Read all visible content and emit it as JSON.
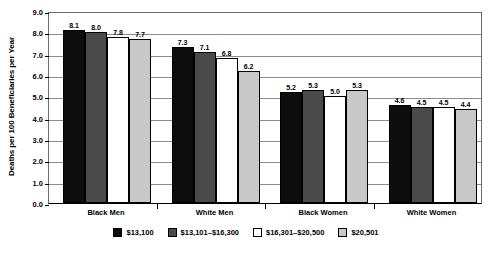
{
  "chart_data": {
    "type": "bar",
    "title": "",
    "xlabel": "",
    "ylabel": "Deaths per 100 Beneficiaries per Year",
    "ylim": [
      0.0,
      9.0
    ],
    "ytick_labels": [
      "0.0",
      "1.0",
      "2.0",
      "3.0",
      "4.0",
      "5.0",
      "6.0",
      "7.0",
      "8.0",
      "9.0"
    ],
    "ytick_values": [
      0.0,
      1.0,
      2.0,
      3.0,
      4.0,
      5.0,
      6.0,
      7.0,
      8.0,
      9.0
    ],
    "grid": true,
    "legend_position": "bottom",
    "categories": [
      "Black Men",
      "White Men",
      "Black Women",
      "White Women"
    ],
    "series": [
      {
        "name": "$13,100",
        "color": "#0d0d0d",
        "values": [
          8.1,
          7.3,
          5.2,
          4.6
        ],
        "labels": [
          "8.1",
          "7.3",
          "5.2",
          "4.6"
        ]
      },
      {
        "name": "$13,101–$16,300",
        "color": "#4a4a4a",
        "values": [
          8.0,
          7.1,
          5.3,
          4.5
        ],
        "labels": [
          "8.0",
          "7.1",
          "5.3",
          "4.5"
        ]
      },
      {
        "name": "$16,301–$20,500",
        "color": "#ffffff",
        "values": [
          7.8,
          6.8,
          5.0,
          4.5
        ],
        "labels": [
          "7.8",
          "6.8",
          "5.0",
          "4.5"
        ]
      },
      {
        "name": "$20,501",
        "color": "#c8c8c8",
        "values": [
          7.7,
          6.2,
          5.3,
          4.4
        ],
        "labels": [
          "7.7",
          "6.2",
          "5.3",
          "4.4"
        ]
      }
    ]
  }
}
